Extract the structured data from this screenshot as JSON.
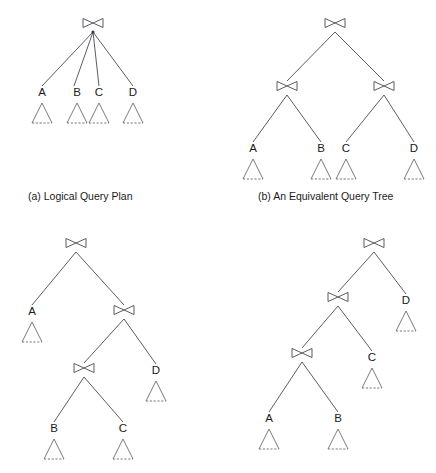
{
  "figure": {
    "background_color": "#ffffff",
    "line_color": "#4a4a52",
    "leaf_color": "#6b6b72",
    "text_color": "#1a1a1a",
    "width": 436,
    "height": 473,
    "join_symbol_name": "natural-join-bowtie",
    "leaf_symbol_name": "relation-triangle"
  },
  "captions": {
    "a": "(a) Logical Query Plan",
    "b": "(b) An Equivalent Query Tree",
    "c": "",
    "d": ""
  },
  "panels": [
    {
      "id": "a",
      "name": "logical-query-plan",
      "caption": "(a) Logical Query Plan",
      "caption_x": 28,
      "caption_y": 190,
      "origin_x": 0,
      "origin_y": 0,
      "width": 218,
      "height": 220,
      "joins": [
        {
          "id": "a-join-root",
          "name": "join-root",
          "x": 93,
          "y": 23,
          "has_dot": true
        }
      ],
      "leaves": [
        {
          "id": "a-leaf-A",
          "label": "A",
          "x": 42,
          "label_y": 96,
          "tri_top_y": 103
        },
        {
          "id": "a-leaf-B",
          "label": "B",
          "x": 77,
          "label_y": 96,
          "tri_top_y": 103
        },
        {
          "id": "a-leaf-C",
          "label": "C",
          "x": 99,
          "label_y": 96,
          "tri_top_y": 103
        },
        {
          "id": "a-leaf-D",
          "label": "D",
          "x": 133,
          "label_y": 96,
          "tri_top_y": 103
        }
      ],
      "edges": [
        {
          "x1": 93,
          "y1": 32,
          "x2": 42,
          "y2": 86
        },
        {
          "x1": 93,
          "y1": 32,
          "x2": 74,
          "y2": 86
        },
        {
          "x1": 93,
          "y1": 32,
          "x2": 99,
          "y2": 86
        },
        {
          "x1": 93,
          "y1": 32,
          "x2": 133,
          "y2": 86
        }
      ]
    },
    {
      "id": "b",
      "name": "equivalent-query-tree",
      "caption": "(b) An Equivalent Query Tree",
      "caption_x": 258,
      "caption_y": 190,
      "origin_x": 218,
      "origin_y": 0,
      "width": 218,
      "height": 220,
      "joins": [
        {
          "id": "b-join-root",
          "name": "join-root",
          "x": 335,
          "y": 23,
          "has_dot": false
        },
        {
          "id": "b-join-left",
          "name": "join-left",
          "x": 287,
          "y": 86,
          "has_dot": false
        },
        {
          "id": "b-join-right",
          "name": "join-right",
          "x": 384,
          "y": 86,
          "has_dot": false
        }
      ],
      "leaves": [
        {
          "id": "b-leaf-A",
          "label": "A",
          "x": 253,
          "label_y": 152,
          "tri_top_y": 159
        },
        {
          "id": "b-leaf-B",
          "label": "B",
          "x": 321,
          "label_y": 152,
          "tri_top_y": 159
        },
        {
          "id": "b-leaf-C",
          "label": "C",
          "x": 346,
          "label_y": 152,
          "tri_top_y": 159
        },
        {
          "id": "b-leaf-D",
          "label": "D",
          "x": 414,
          "label_y": 152,
          "tri_top_y": 159
        }
      ],
      "edges": [
        {
          "x1": 335,
          "y1": 32,
          "x2": 287,
          "y2": 81
        },
        {
          "x1": 335,
          "y1": 32,
          "x2": 384,
          "y2": 81
        },
        {
          "x1": 287,
          "y1": 95,
          "x2": 253,
          "y2": 142
        },
        {
          "x1": 287,
          "y1": 95,
          "x2": 321,
          "y2": 142
        },
        {
          "x1": 384,
          "y1": 95,
          "x2": 346,
          "y2": 142
        },
        {
          "x1": 384,
          "y1": 95,
          "x2": 414,
          "y2": 142
        }
      ]
    },
    {
      "id": "c",
      "name": "left-deep-variant-query-tree",
      "caption": "",
      "caption_x": 0,
      "caption_y": 0,
      "origin_x": 0,
      "origin_y": 220,
      "width": 218,
      "height": 253,
      "joins": [
        {
          "id": "c-join-root",
          "name": "join-root",
          "x": 76,
          "y": 243,
          "has_dot": false
        },
        {
          "id": "c-join-mid",
          "name": "join-mid",
          "x": 124,
          "y": 310,
          "has_dot": false
        },
        {
          "id": "c-join-low",
          "name": "join-low",
          "x": 84,
          "y": 368,
          "has_dot": false
        }
      ],
      "leaves": [
        {
          "id": "c-leaf-A",
          "label": "A",
          "x": 32,
          "label_y": 315,
          "tri_top_y": 322
        },
        {
          "id": "c-leaf-D",
          "label": "D",
          "x": 156,
          "label_y": 374,
          "tri_top_y": 381
        },
        {
          "id": "c-leaf-B",
          "label": "B",
          "x": 54,
          "label_y": 432,
          "tri_top_y": 439
        },
        {
          "id": "c-leaf-C",
          "label": "C",
          "x": 123,
          "label_y": 432,
          "tri_top_y": 439
        }
      ],
      "edges": [
        {
          "x1": 76,
          "y1": 252,
          "x2": 32,
          "y2": 305
        },
        {
          "x1": 76,
          "y1": 252,
          "x2": 124,
          "y2": 305
        },
        {
          "x1": 124,
          "y1": 319,
          "x2": 84,
          "y2": 363
        },
        {
          "x1": 124,
          "y1": 319,
          "x2": 156,
          "y2": 364
        },
        {
          "x1": 84,
          "y1": 377,
          "x2": 54,
          "y2": 422
        },
        {
          "x1": 84,
          "y1": 377,
          "x2": 123,
          "y2": 422
        }
      ]
    },
    {
      "id": "d",
      "name": "right-deep-variant-query-tree",
      "caption": "",
      "caption_x": 0,
      "caption_y": 0,
      "origin_x": 218,
      "origin_y": 220,
      "width": 218,
      "height": 253,
      "joins": [
        {
          "id": "d-join-root",
          "name": "join-root",
          "x": 374,
          "y": 243,
          "has_dot": false
        },
        {
          "id": "d-join-mid",
          "name": "join-mid",
          "x": 338,
          "y": 297,
          "has_dot": false
        },
        {
          "id": "d-join-low",
          "name": "join-low",
          "x": 302,
          "y": 353,
          "has_dot": false
        }
      ],
      "leaves": [
        {
          "id": "d-leaf-D",
          "label": "D",
          "x": 406,
          "label_y": 304,
          "tri_top_y": 311
        },
        {
          "id": "d-leaf-C",
          "label": "C",
          "x": 372,
          "label_y": 361,
          "tri_top_y": 368
        },
        {
          "id": "d-leaf-A",
          "label": "A",
          "x": 269,
          "label_y": 422,
          "tri_top_y": 429
        },
        {
          "id": "d-leaf-B",
          "label": "B",
          "x": 338,
          "label_y": 422,
          "tri_top_y": 429
        }
      ],
      "edges": [
        {
          "x1": 374,
          "y1": 252,
          "x2": 338,
          "y2": 292
        },
        {
          "x1": 374,
          "y1": 252,
          "x2": 406,
          "y2": 294
        },
        {
          "x1": 338,
          "y1": 306,
          "x2": 302,
          "y2": 348
        },
        {
          "x1": 338,
          "y1": 306,
          "x2": 372,
          "y2": 351
        },
        {
          "x1": 302,
          "y1": 362,
          "x2": 269,
          "y2": 412
        },
        {
          "x1": 302,
          "y1": 362,
          "x2": 338,
          "y2": 412
        }
      ]
    }
  ],
  "geometry": {
    "bowtie_half_width": 10,
    "bowtie_half_height": 4.5,
    "triangle_half_width": 10,
    "triangle_height": 20
  }
}
